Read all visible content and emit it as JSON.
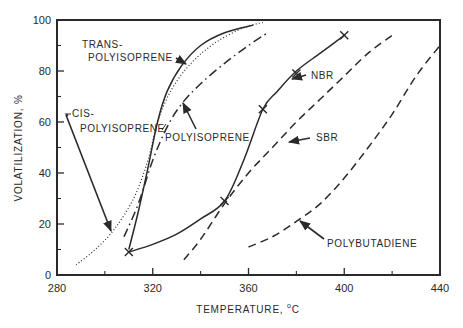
{
  "chart_data": {
    "type": "line",
    "title": "",
    "xlabel": "TEMPERATURE, °C",
    "xlabel_main": "TEMPERATURE, ",
    "xlabel_sup": "o",
    "xlabel_unit": "C",
    "ylabel": "VOLATILIZATION, %",
    "xlim": [
      280,
      440
    ],
    "ylim": [
      0,
      100
    ],
    "x_ticks": [
      280,
      320,
      360,
      400,
      440
    ],
    "x_minor_ticks": [
      300,
      340,
      380,
      420
    ],
    "y_ticks": [
      0,
      20,
      40,
      60,
      80,
      100
    ],
    "y_minor_ticks": [
      10,
      30,
      50,
      70,
      90
    ],
    "grid": false,
    "legend": "inline labels with arrows",
    "series": [
      {
        "name": "TRANS-POLYISOPRENE",
        "style": "solid",
        "points": [
          [
            310,
            10
          ],
          [
            314,
            25
          ],
          [
            318,
            42
          ],
          [
            322,
            60
          ],
          [
            326,
            72
          ],
          [
            332,
            82
          ],
          [
            340,
            90
          ],
          [
            350,
            95
          ],
          [
            362,
            98
          ]
        ]
      },
      {
        "name": "CIS-POLYISOPRENE",
        "style": "dotted",
        "points": [
          [
            288,
            4
          ],
          [
            296,
            10
          ],
          [
            304,
            18
          ],
          [
            312,
            30
          ],
          [
            318,
            45
          ],
          [
            322,
            60
          ],
          [
            328,
            73
          ],
          [
            336,
            83
          ],
          [
            346,
            91
          ],
          [
            358,
            97
          ],
          [
            366,
            99
          ]
        ]
      },
      {
        "name": "POLYISOPRENE",
        "style": "dash-dot",
        "points": [
          [
            308,
            15
          ],
          [
            314,
            28
          ],
          [
            320,
            45
          ],
          [
            326,
            58
          ],
          [
            332,
            67
          ],
          [
            340,
            75
          ],
          [
            350,
            83
          ],
          [
            360,
            90
          ],
          [
            368,
            95
          ]
        ]
      },
      {
        "name": "NBR",
        "style": "solid-with-x-markers",
        "points": [
          [
            310,
            9
          ],
          [
            320,
            12
          ],
          [
            330,
            16
          ],
          [
            340,
            22
          ],
          [
            350,
            29
          ],
          [
            358,
            45
          ],
          [
            366,
            65
          ],
          [
            372,
            72
          ],
          [
            380,
            80
          ],
          [
            390,
            87
          ],
          [
            400,
            94
          ]
        ],
        "markers": [
          [
            310,
            9
          ],
          [
            350,
            29
          ],
          [
            366,
            65
          ],
          [
            380,
            79
          ],
          [
            400,
            94
          ]
        ]
      },
      {
        "name": "SBR",
        "style": "dashed",
        "points": [
          [
            333,
            6
          ],
          [
            340,
            14
          ],
          [
            350,
            28
          ],
          [
            360,
            40
          ],
          [
            370,
            50
          ],
          [
            380,
            60
          ],
          [
            390,
            69
          ],
          [
            400,
            78
          ],
          [
            410,
            87
          ],
          [
            420,
            94
          ]
        ]
      },
      {
        "name": "POLYBUTADIENE",
        "style": "dashed",
        "points": [
          [
            360,
            11
          ],
          [
            370,
            15
          ],
          [
            380,
            21
          ],
          [
            390,
            28
          ],
          [
            400,
            38
          ],
          [
            410,
            50
          ],
          [
            420,
            63
          ],
          [
            430,
            78
          ],
          [
            440,
            90
          ]
        ]
      }
    ],
    "annotations": [
      {
        "text": "TRANS-",
        "text2": "POLYISOPRENE",
        "points_to": "TRANS-POLYISOPRENE"
      },
      {
        "text": "CIS-",
        "text2": "POLYISOPRENE",
        "points_to": "CIS-POLYISOPRENE"
      },
      {
        "text": "POLYISOPRENE",
        "points_to": "POLYISOPRENE"
      },
      {
        "text": "NBR",
        "points_to": "NBR"
      },
      {
        "text": "SBR",
        "points_to": "SBR"
      },
      {
        "text": "POLYBUTADIENE",
        "points_to": "POLYBUTADIENE"
      }
    ]
  },
  "labels": {
    "trans_1": "TRANS-",
    "trans_2": "POLYISOPRENE",
    "cis_1": "CIS-",
    "cis_2": "POLYISOPRENE",
    "polyisoprene": "POLYISOPRENE",
    "nbr": "NBR",
    "sbr": "SBR",
    "polybutadiene": "POLYBUTADIENE"
  },
  "colors": {
    "ink": "#2a2a2a",
    "background": "#ffffff"
  }
}
